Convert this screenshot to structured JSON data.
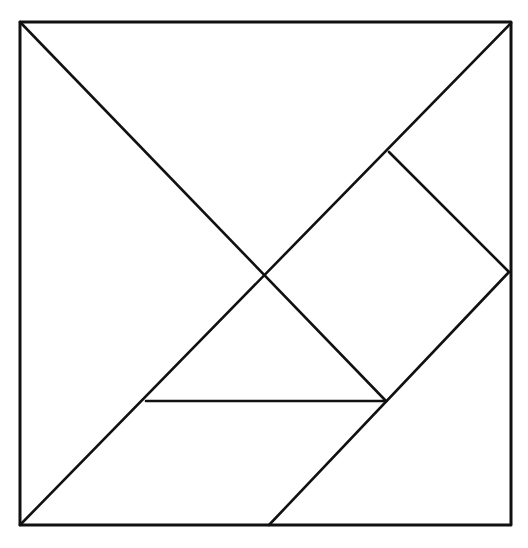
{
  "diagram": {
    "type": "tangram",
    "stroke_color": "#111111",
    "background_color": "#ffffff",
    "outer_square": {
      "x1": 20,
      "y1": 22,
      "x2": 511,
      "y2": 525
    },
    "points": {
      "top_left": [
        20,
        22
      ],
      "top_right": [
        511,
        23
      ],
      "bottom_left": [
        20,
        525
      ],
      "bottom_right": [
        511,
        525
      ],
      "center": [
        265,
        274
      ],
      "upper_right_mid": [
        389,
        152
      ],
      "right_mid": [
        509,
        272
      ],
      "inner_right": [
        386,
        401
      ],
      "inner_left": [
        146,
        401
      ],
      "bottom_mid": [
        269,
        525
      ]
    },
    "pieces": [
      {
        "name": "large-triangle-top",
        "points": "20,22 511,23 265,274"
      },
      {
        "name": "large-triangle-left",
        "points": "20,22 265,274 20,525"
      },
      {
        "name": "square",
        "points": "265,274 389,152 509,272 386,401"
      },
      {
        "name": "small-triangle-upper-right",
        "points": "389,152 511,23 509,272"
      },
      {
        "name": "small-triangle-middle",
        "points": "146,401 265,274 386,401"
      },
      {
        "name": "parallelogram",
        "points": "20,525 146,401 386,401 269,525"
      },
      {
        "name": "medium-triangle",
        "points": "269,525 509,272 511,525"
      }
    ]
  }
}
